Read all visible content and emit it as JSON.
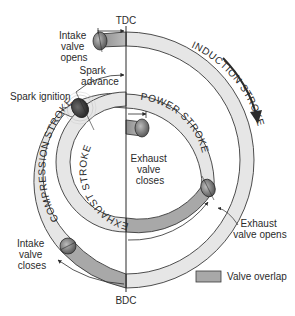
{
  "figure": {
    "type": "four-stroke valve timing spiral diagram",
    "reference_line": {
      "top_label": "TDC",
      "bottom_label": "BDC"
    },
    "strokes": [
      {
        "id": "induction",
        "label": "INDUCTION STROKE"
      },
      {
        "id": "compression",
        "label": "COMPRESSION STROKE"
      },
      {
        "id": "power",
        "label": "POWER STROKE"
      },
      {
        "id": "exhaust",
        "label": "EXHAUST STROKE"
      }
    ],
    "events": {
      "intake_opens": "Intake valve opens",
      "intake_opens_lines": [
        "Intake",
        "valve",
        "opens"
      ],
      "intake_closes_lines": [
        "Intake",
        "valve",
        "closes"
      ],
      "spark_advance_lines": [
        "Spark",
        "advance"
      ],
      "spark_ignition": "Spark ignition",
      "exhaust_closes_lines": [
        "Exhaust",
        "valve",
        "closes"
      ],
      "exhaust_opens_lines": [
        "Exhaust",
        "valve opens"
      ]
    },
    "legend": {
      "label": "Valve overlap",
      "swatch_color": "#a8a8a8"
    },
    "rotation_direction": "clockwise",
    "colors": {
      "band_fill": "#e6e6e6",
      "overlap_fill": "#a8a8a8",
      "outline": "#3a3a3a",
      "valve_fill": "#7a7a7a",
      "spark_fill": "#3c3c3c"
    }
  }
}
